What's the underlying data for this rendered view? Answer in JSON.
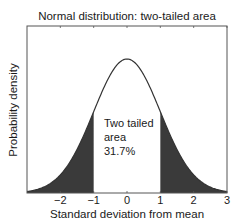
{
  "chart_data": {
    "type": "area",
    "title": "Normal distribution: two-tailed area",
    "xlabel": "Standard deviation from mean",
    "ylabel": "Probability density",
    "xlim": [
      -3,
      3
    ],
    "ylim": [
      0,
      0.5
    ],
    "x_ticks": [
      -2,
      -1,
      0,
      1,
      2,
      3
    ],
    "x_tick_labels": [
      "−2",
      "−1",
      "0",
      "1",
      "2",
      "3"
    ],
    "y_ticks_visible": false,
    "grid": false,
    "legend": null,
    "series": [
      {
        "name": "Standard normal PDF",
        "mean": 0,
        "sd": 1,
        "x": [
          -3,
          -2.5,
          -2,
          -1.5,
          -1,
          -0.5,
          0,
          0.5,
          1,
          1.5,
          2,
          2.5,
          3
        ],
        "y": [
          0.0044,
          0.0175,
          0.054,
          0.1295,
          0.242,
          0.3521,
          0.3989,
          0.3521,
          0.242,
          0.1295,
          0.054,
          0.0175,
          0.0044
        ]
      }
    ],
    "shaded_regions": [
      {
        "from": -3,
        "to": -1,
        "label": "left tail"
      },
      {
        "from": 1,
        "to": 3,
        "label": "right tail"
      }
    ],
    "annotations": [
      {
        "lines": [
          "Two tailed",
          "area",
          "31.7%"
        ],
        "x": -0.7,
        "y": 0.15
      }
    ],
    "colors": {
      "curve": "#333333",
      "fill": "#3a3a3a",
      "axes": "#555555"
    }
  },
  "plot": {
    "left": 27,
    "right": 227,
    "top": 26,
    "bottom": 193,
    "peak_y_px": 59
  }
}
